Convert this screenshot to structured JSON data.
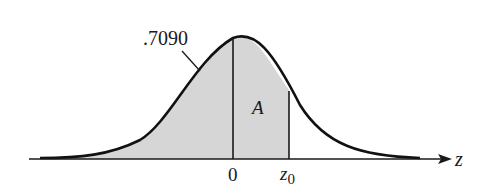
{
  "diagram": {
    "area_label_left": ".7090",
    "area_label_region": "A",
    "axis_variable": "z",
    "tick_zero": "0",
    "tick_z0_main": "z",
    "tick_z0_sub": "0",
    "colors": {
      "curve": "#111111",
      "shade": "#d6d6d6",
      "axis": "#1a1a1a"
    }
  }
}
